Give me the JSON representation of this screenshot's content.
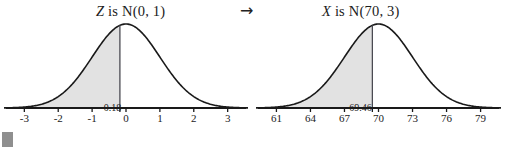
{
  "figure": {
    "transform_arrow": "→",
    "arrow_icon_name": "right-arrow-icon"
  },
  "chart_data": [
    {
      "type": "area",
      "id": "standard-normal",
      "title_variable": "Z",
      "title_rest": " is N(0, 1)",
      "title": "Z is N(0, 1)",
      "distribution": {
        "name": "normal",
        "mean": 0,
        "sd": 1
      },
      "xlabel": "",
      "ylabel": "",
      "xlim": [
        -3.6,
        3.6
      ],
      "ticks": [
        -3,
        -2,
        -1,
        0,
        1,
        2,
        3
      ],
      "tick_labels": [
        "-3",
        "-2",
        "-1",
        "0",
        "1",
        "2",
        "3"
      ],
      "grid": false,
      "legend": "none",
      "cutoff_value": -0.18,
      "cutoff_label": "-0.18",
      "shaded_region": "left-tail",
      "shaded_from": -3.6,
      "shaded_to": -0.18,
      "shade_color": "#e2e2e2",
      "curve_color": "#1a1a1a",
      "axis_color": "#1a1a1a"
    },
    {
      "type": "area",
      "id": "transformed-normal",
      "title_variable": "X",
      "title_rest": " is N(70, 3)",
      "title": "X is N(70, 3)",
      "distribution": {
        "name": "normal",
        "mean": 70,
        "sd": 3
      },
      "xlabel": "",
      "ylabel": "",
      "xlim": [
        59.2,
        80.8
      ],
      "ticks": [
        61,
        64,
        67,
        70,
        73,
        76,
        79
      ],
      "tick_labels": [
        "61",
        "64",
        "67",
        "70",
        "73",
        "76",
        "79"
      ],
      "grid": false,
      "legend": "none",
      "cutoff_value": 69.46,
      "cutoff_label": "69.46",
      "shaded_region": "left-tail",
      "shaded_from": 59.2,
      "shaded_to": 69.46,
      "shade_color": "#e2e2e2",
      "curve_color": "#1a1a1a",
      "axis_color": "#1a1a1a"
    }
  ]
}
